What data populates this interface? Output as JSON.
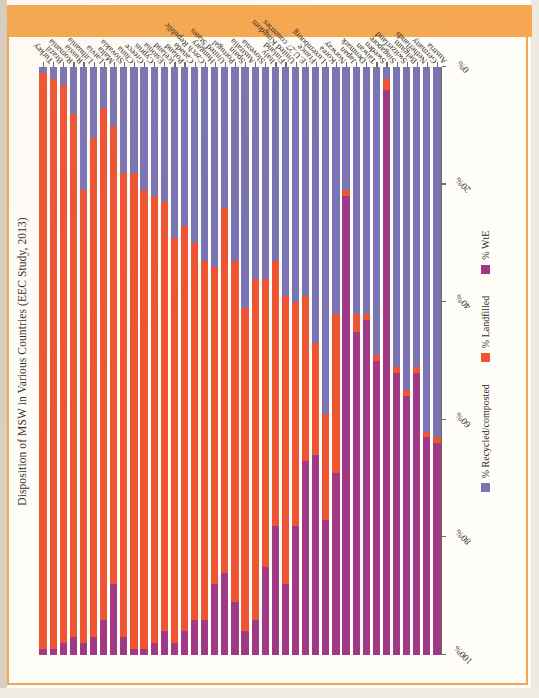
{
  "document": {
    "header_band_color": "#f5a851",
    "page_background": "#fffdf8"
  },
  "chart_data": {
    "type": "bar",
    "orientation": "horizontal-stacked",
    "stacked": true,
    "stack_total": 100,
    "title": "Disposition of MSW in Various Countries (EEC Study, 2013)",
    "xlabel": "",
    "ylabel": "",
    "xlim": [
      0,
      100
    ],
    "x_axis_reversed": true,
    "grid": false,
    "legend_position": "bottom",
    "tick_labels": [
      "100%",
      "80%",
      "60%",
      "40%",
      "20%",
      "0%"
    ],
    "tick_values": [
      100,
      80,
      60,
      40,
      20,
      0
    ],
    "legend": [
      "% Recycled/composted",
      "% Landfilled",
      "% WtE"
    ],
    "colors": {
      "recycled": "#7b74b4",
      "landfilled": "#ef5533",
      "wte": "#a03a86"
    },
    "categories": [
      "Austria",
      "Germany",
      "Netherlands",
      "Belgium",
      "Switzerland",
      "Singapore",
      "Sweden",
      "Taiwan",
      "Denmark",
      "Japan",
      "Norway",
      "Korea",
      "Luxembourg",
      "France",
      "E.U.27 countries",
      "United Kingdom",
      "Finland",
      "Italy",
      "Slovenia",
      "Australia",
      "Spain",
      "Portugal",
      "United States",
      "Hungary",
      "Czech Republic",
      "Canada",
      "Poland",
      "Iceland",
      "Estonia",
      "Cyprus",
      "Greece",
      "China",
      "Slovakia",
      "Malta",
      "Latvia",
      "Lithuania",
      "Russia",
      "Romania",
      "Brazil",
      "Turkey"
    ],
    "series": [
      {
        "name": "% Recycled/composted",
        "key": "recycled",
        "values": [
          63,
          62,
          51,
          55,
          51,
          2,
          49,
          42,
          42,
          21,
          42,
          59,
          47,
          39,
          40,
          39,
          33,
          36,
          36,
          41,
          33,
          24,
          34,
          33,
          30,
          27,
          29,
          23,
          22,
          21,
          18,
          18,
          10,
          7,
          12,
          21,
          8,
          3,
          2,
          1
        ]
      },
      {
        "name": "% Landfilled",
        "key": "landfilled",
        "values": [
          1,
          1,
          1,
          1,
          1,
          2,
          1,
          1,
          3,
          1,
          27,
          18,
          19,
          28,
          38,
          49,
          45,
          49,
          58,
          55,
          58,
          62,
          54,
          61,
          64,
          69,
          69,
          73,
          76,
          78,
          81,
          79,
          78,
          87,
          85,
          77,
          89,
          95,
          97,
          98
        ]
      },
      {
        "name": "% WtE",
        "key": "wte",
        "values": [
          36,
          37,
          48,
          44,
          48,
          96,
          50,
          57,
          55,
          78,
          31,
          23,
          34,
          33,
          22,
          12,
          22,
          15,
          6,
          4,
          9,
          14,
          12,
          6,
          6,
          4,
          2,
          4,
          2,
          1,
          1,
          3,
          12,
          6,
          3,
          2,
          3,
          2,
          1,
          1
        ]
      }
    ]
  },
  "legend_items": [
    {
      "label": "% Recycled/composted",
      "swatch_class": "sw-rec"
    },
    {
      "label": "% Landfilled",
      "swatch_class": "sw-lf"
    },
    {
      "label": "% WtE",
      "swatch_class": "sw-wte"
    }
  ]
}
